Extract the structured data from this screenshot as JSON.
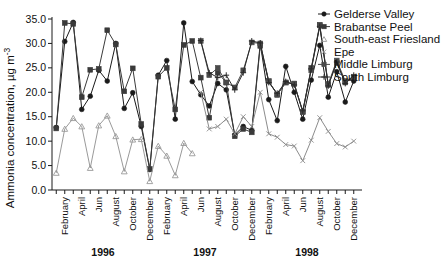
{
  "chart_data": {
    "type": "line",
    "title": "",
    "xlabel": "",
    "ylabel": "Ammonia concentration, µg m",
    "ylabel_exponent": "-3",
    "ylim": [
      0,
      35
    ],
    "ytick_values": [
      0,
      5,
      10,
      15,
      20,
      25,
      30,
      35
    ],
    "ytick_labels": [
      "0.0",
      "5.0",
      "10.0",
      "15.0",
      "20.0",
      "25.0",
      "30.0",
      "35.0"
    ],
    "grid": false,
    "legend_position": "top-right",
    "month_labels": [
      "February",
      "April",
      "Jun",
      "August",
      "October",
      "December"
    ],
    "month_label_indices": [
      1,
      3,
      5,
      7,
      9,
      11
    ],
    "x_tick_count": 36,
    "year_groups": [
      {
        "label": "1996",
        "start_index": 0,
        "end_index": 11
      },
      {
        "label": "1997",
        "start_index": 12,
        "end_index": 23
      },
      {
        "label": "1998",
        "start_index": 24,
        "end_index": 35
      }
    ],
    "x": [
      "1996-01",
      "1996-02",
      "1996-03",
      "1996-04",
      "1996-05",
      "1996-06",
      "1996-07",
      "1996-08",
      "1996-09",
      "1996-10",
      "1996-11",
      "1996-12",
      "1997-01",
      "1997-02",
      "1997-03",
      "1997-04",
      "1997-05",
      "1997-06",
      "1997-07",
      "1997-08",
      "1997-09",
      "1997-10",
      "1997-11",
      "1997-12",
      "1998-01",
      "1998-02",
      "1998-03",
      "1998-04",
      "1998-05",
      "1998-06",
      "1998-07",
      "1998-08",
      "1998-09",
      "1998-10",
      "1998-11",
      "1998-12"
    ],
    "series": [
      {
        "name": "Gelderse Valley",
        "marker": "circle",
        "color": "#1a1a1a",
        "values": [
          12.8,
          30.4,
          34.3,
          16.5,
          19.2,
          24.5,
          22.3,
          30.0,
          16.7,
          19.9,
          13.0,
          4.2,
          23.5,
          26.5,
          14.5,
          34.2,
          22.2,
          19.5,
          17.2,
          21.8,
          20.5,
          11.3,
          13.0,
          12.2,
          30.0,
          18.5,
          14.2,
          25.3,
          20.0,
          14.5,
          22.5,
          29.6,
          19.0,
          24.2,
          18.0,
          22.3
        ]
      },
      {
        "name": "Brabantse Peel",
        "marker": "square",
        "color": "#3a3a3a",
        "values": [
          12.6,
          34.2,
          34.0,
          19.0,
          24.6,
          24.8,
          32.7,
          29.8,
          20.2,
          24.9,
          13.5,
          4.3,
          23.2,
          25.0,
          16.5,
          29.7,
          30.5,
          23.0,
          14.8,
          24.0,
          22.0,
          11.0,
          12.5,
          11.8,
          29.5,
          22.2,
          19.5,
          22.0,
          21.7,
          16.0,
          25.0,
          33.8,
          21.5,
          26.0,
          22.0,
          23.0
        ]
      },
      {
        "name": "South-east Friesland",
        "marker": "triangle",
        "color": "#9a9a9a",
        "values": [
          3.5,
          12.5,
          14.7,
          13.0,
          4.5,
          13.2,
          15.2,
          11.0,
          3.8,
          10.3,
          10.4,
          1.8,
          9.0,
          7.0,
          3.0,
          9.6,
          7.5,
          null,
          null,
          null,
          null,
          null,
          null,
          null,
          null,
          null,
          null,
          null,
          null,
          null,
          null,
          null,
          null,
          null,
          null,
          null
        ]
      },
      {
        "name": "Epe",
        "marker": "cross",
        "color": "#8c8c8c",
        "values": [
          null,
          null,
          null,
          null,
          null,
          null,
          null,
          null,
          null,
          null,
          null,
          null,
          null,
          null,
          null,
          null,
          null,
          20.0,
          12.5,
          13.0,
          14.5,
          11.5,
          15.0,
          13.0,
          20.0,
          11.5,
          10.8,
          9.3,
          9.0,
          6.0,
          10.2,
          14.8,
          12.0,
          9.5,
          8.8,
          10.0
        ]
      },
      {
        "name": "Middle Limburg",
        "marker": "square",
        "color": "#4a4a4a",
        "values": [
          null,
          null,
          null,
          null,
          null,
          null,
          null,
          null,
          null,
          null,
          null,
          null,
          null,
          null,
          null,
          null,
          null,
          30.5,
          23.5,
          25.0,
          22.0,
          21.0,
          24.5,
          30.2,
          30.0,
          22.3,
          19.5,
          22.0,
          21.8,
          16.0,
          24.5,
          33.7,
          21.7,
          26.5,
          22.3,
          23.2
        ]
      },
      {
        "name": "South Limburg",
        "marker": "plus",
        "color": "#2a2a2a",
        "values": [
          null,
          null,
          null,
          null,
          null,
          null,
          null,
          null,
          null,
          null,
          null,
          null,
          null,
          null,
          null,
          null,
          null,
          30.6,
          24.0,
          23.0,
          23.5,
          20.5,
          24.0,
          30.5,
          30.1,
          22.0,
          19.8,
          22.2,
          21.5,
          16.2,
          24.8,
          33.5,
          21.3,
          26.2,
          21.8,
          23.5
        ]
      }
    ]
  },
  "legend": {
    "items": [
      {
        "label": "Gelderse Valley"
      },
      {
        "label": "Brabantse Peel"
      },
      {
        "label": "South-east Friesland"
      },
      {
        "label": "Epe"
      },
      {
        "label": "Middle Limburg"
      },
      {
        "label": "South Limburg"
      }
    ]
  },
  "axes": {
    "y_axis_title": "Ammonia concentration, µg m-3",
    "year_1996": "1996",
    "year_1997": "1997",
    "year_1998": "1998"
  }
}
